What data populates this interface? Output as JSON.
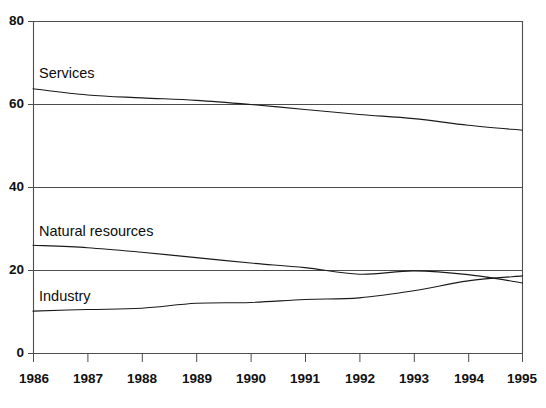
{
  "chart_data": {
    "type": "line",
    "title": "",
    "subtitle": "",
    "xlabel": "",
    "ylabel": "",
    "xlim": [
      1986,
      1995
    ],
    "ylim": [
      0,
      80
    ],
    "grid": true,
    "legend_position": "inline-labels",
    "x": [
      1986,
      1987,
      1988,
      1989,
      1990,
      1991,
      1992,
      1993,
      1994,
      1995
    ],
    "x_tick_labels": [
      "1986",
      "1987",
      "1988",
      "1989",
      "1990",
      "1991",
      "1992",
      "1993",
      "1994",
      "1995"
    ],
    "y_tick_labels": [
      "0",
      "20",
      "40",
      "60",
      "80"
    ],
    "y_ticks": [
      0,
      20,
      40,
      60,
      80
    ],
    "series": [
      {
        "name": "Services",
        "label": "Services",
        "color": "#1a1a1a",
        "values": [
          63.8,
          62.3,
          61.6,
          61.0,
          60.0,
          58.8,
          57.6,
          56.6,
          55.0,
          53.8
        ]
      },
      {
        "name": "Natural resources",
        "label": "Natural resources",
        "color": "#1a1a1a",
        "values": [
          26.1,
          25.5,
          24.4,
          23.1,
          21.8,
          20.7,
          19.1,
          19.9,
          19.0,
          17.0
        ]
      },
      {
        "name": "Industry",
        "label": "Industry",
        "color": "#1a1a1a",
        "values": [
          10.2,
          10.6,
          10.9,
          12.1,
          12.3,
          13.0,
          13.4,
          15.1,
          17.5,
          18.7
        ]
      }
    ]
  },
  "labels": {
    "services": "Services",
    "natural_resources": "Natural resources",
    "industry": "Industry"
  },
  "y_axis": {
    "t0": "0",
    "t20": "20",
    "t40": "40",
    "t60": "60",
    "t80": "80"
  },
  "x_axis": {
    "y1986": "1986",
    "y1987": "1987",
    "y1988": "1988",
    "y1989": "1989",
    "y1990": "1990",
    "y1991": "1991",
    "y1992": "1992",
    "y1993": "1993",
    "y1994": "1994",
    "y1995": "1995"
  },
  "colors": {
    "line": "#1a1a1a",
    "axis": "#4d4d4d",
    "background": "#ffffff"
  }
}
